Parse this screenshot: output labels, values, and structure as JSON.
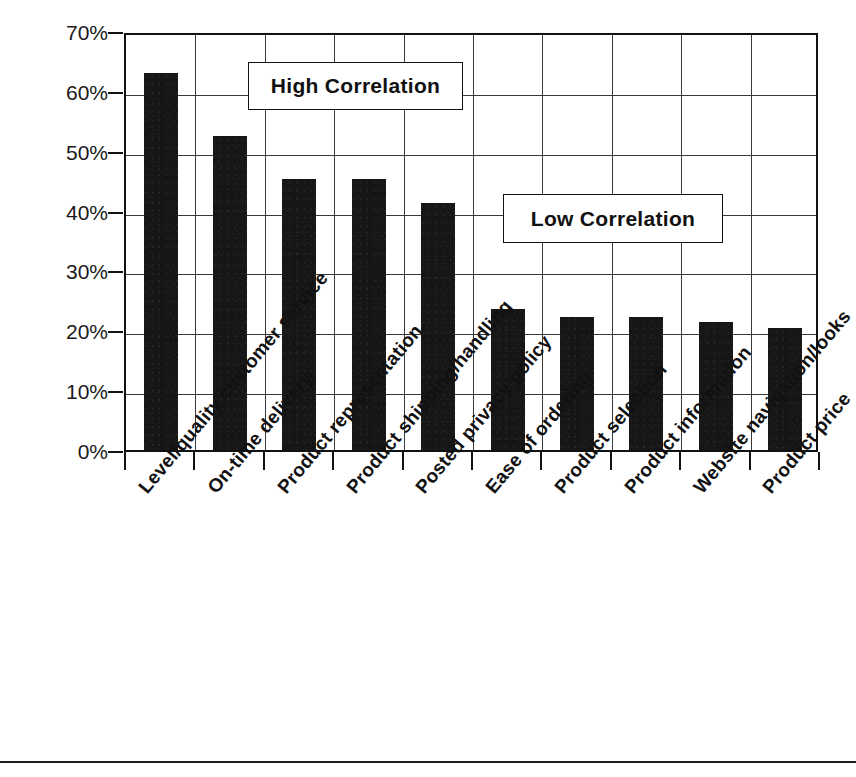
{
  "chart_data": {
    "type": "bar",
    "title": "",
    "xlabel": "",
    "ylabel": "",
    "ylim": [
      0,
      70
    ],
    "ytick_labels": [
      "70%",
      "60%",
      "50%",
      "40%",
      "30%",
      "20%",
      "10%",
      "0%"
    ],
    "ytick_values": [
      70,
      60,
      50,
      40,
      30,
      20,
      10,
      0
    ],
    "grid": true,
    "legend": "none",
    "units": "percent",
    "categories": [
      "Level/quality customer service",
      "On-time delivery",
      "Product representation",
      "Product shipping/handling",
      "Posted privacy policy",
      "Ease of ordering",
      "Product selection",
      "Product information",
      "Website navigation/looks",
      "Product price"
    ],
    "values": [
      63.0,
      52.5,
      45.3,
      45.3,
      41.2,
      23.6,
      22.3,
      22.3,
      21.4,
      20.4
    ],
    "annotations": [
      {
        "text": "High Correlation",
        "group": [
          0,
          1,
          2,
          3,
          4
        ]
      },
      {
        "text": "Low Correlation",
        "group": [
          5,
          6,
          7,
          8,
          9
        ]
      }
    ],
    "bar_color": "#161616"
  },
  "annotations": {
    "high_correlation": "High Correlation",
    "low_correlation": "Low Correlation"
  }
}
